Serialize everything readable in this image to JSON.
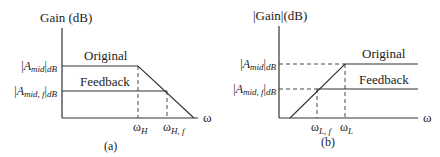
{
  "panel_a": {
    "caption": "(a)",
    "ylabel": "Gain (dB)",
    "xlabel": "ω",
    "ytick_top": {
      "bar": "|",
      "main": "A",
      "sub": "mid",
      "close": "|",
      "unit": "dB"
    },
    "ytick_bottom": {
      "bar": "|",
      "main": "A",
      "sub": "mid, f",
      "close": "|",
      "unit": "dB"
    },
    "xtick_1": {
      "main": "ω",
      "sub": "H"
    },
    "xtick_2": {
      "main": "ω",
      "sub": "H, f"
    },
    "label_original": "Original",
    "label_feedback": "Feedback"
  },
  "panel_b": {
    "caption": "(b)",
    "ylabel": "|Gain|(dB)",
    "xlabel": "ω",
    "ytick_top": {
      "bar": "|",
      "main": "A",
      "sub": "mid",
      "close": "|",
      "unit": "dB"
    },
    "ytick_bottom": {
      "bar": "|",
      "main": "A",
      "sub": "mid, f",
      "close": "|",
      "unit": "dB"
    },
    "xtick_1": {
      "main": "ω",
      "sub": "L, f"
    },
    "xtick_2": {
      "main": "ω",
      "sub": "L"
    },
    "label_original": "Original",
    "label_feedback": "Feedback"
  }
}
